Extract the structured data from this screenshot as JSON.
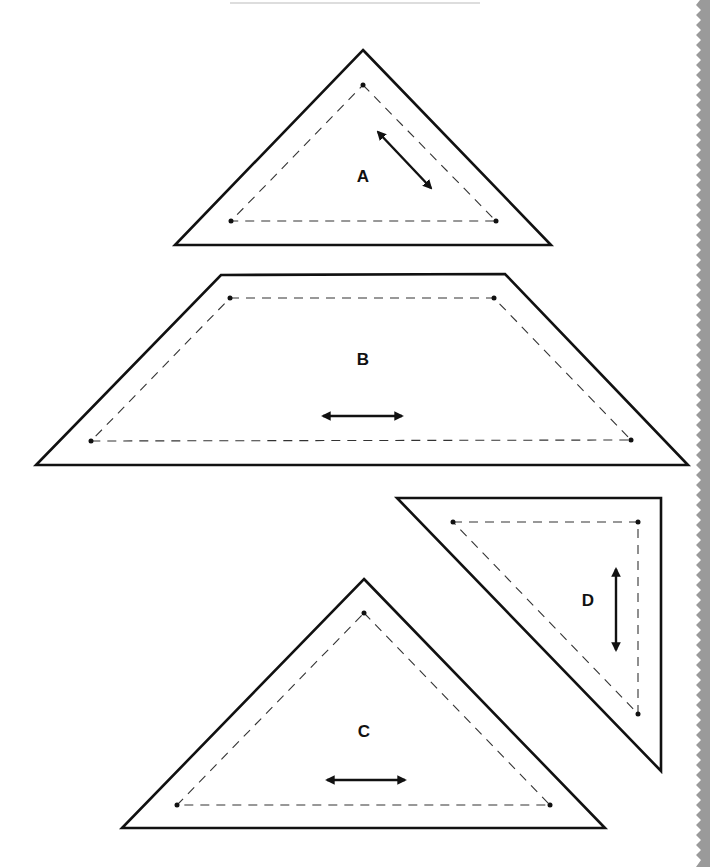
{
  "page": {
    "type": "quilt template pattern pieces",
    "edge_color": "#9a9a9a"
  },
  "pieces": [
    {
      "id": "A",
      "label": "A",
      "shape": "triangle",
      "grain": "diagonal"
    },
    {
      "id": "B",
      "label": "B",
      "shape": "trapezoid",
      "grain": "horizontal"
    },
    {
      "id": "D",
      "label": "D",
      "shape": "right-triangle",
      "grain": "vertical"
    },
    {
      "id": "C",
      "label": "C",
      "shape": "triangle",
      "grain": "horizontal"
    }
  ]
}
